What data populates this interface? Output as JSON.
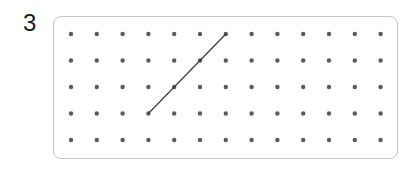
{
  "question": {
    "number": "3"
  },
  "dot_grid": {
    "columns": 13,
    "rows": 5,
    "origin_x": 71,
    "origin_y": 34,
    "spacing_x": 25.8,
    "spacing_y": 26.5,
    "dot_color": "#5a5a5a",
    "dot_radius": 2.2
  },
  "segments": [
    {
      "from": {
        "col": 3,
        "row": 3
      },
      "to": {
        "col": 6,
        "row": 0
      },
      "color": "#3a3a3a"
    }
  ]
}
